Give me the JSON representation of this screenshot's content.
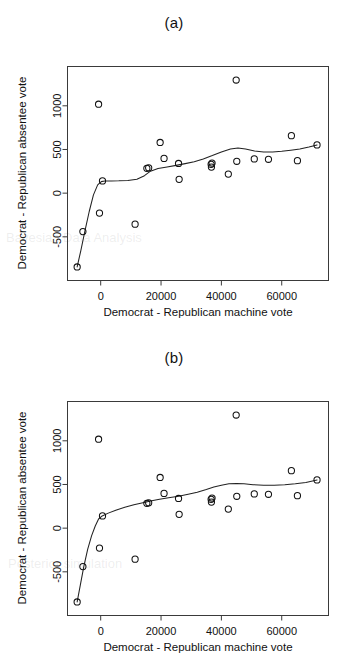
{
  "figure": {
    "background": "#ffffff",
    "ink": "#111111",
    "panels": [
      {
        "id": "a",
        "title": "(a)",
        "fit_label": "loess-smooth-fit"
      },
      {
        "id": "b",
        "title": "(b)",
        "fit_label": "monotone-smooth-fit"
      }
    ]
  },
  "chart_data": [
    {
      "type": "scatter",
      "title": "(a)",
      "xlabel": "Democrat - Republican machine vote",
      "ylabel": "Democrat - Republican absentee vote",
      "xlim": [
        -11000,
        75500
      ],
      "ylim": [
        -1000,
        1450
      ],
      "xticks": [
        0,
        20000,
        40000,
        60000
      ],
      "xticklabels": [
        "0",
        "20000",
        "40000",
        "60000"
      ],
      "yticks": [
        -500,
        0,
        500,
        1000
      ],
      "yticklabels": [
        "-500",
        "0",
        "500",
        "1000"
      ],
      "grid": false,
      "legend": "none",
      "marker": "open-circle",
      "x": [
        -7800,
        -5900,
        -700,
        -400,
        600,
        11400,
        15300,
        15900,
        19700,
        21000,
        25800,
        26000,
        36600,
        36700,
        36900,
        42300,
        44900,
        45100,
        50900,
        55600,
        63200,
        65200,
        71700
      ],
      "y": [
        -845,
        -440,
        1018,
        -228,
        140,
        -355,
        285,
        290,
        580,
        398,
        340,
        158,
        330,
        298,
        345,
        218,
        1295,
        365,
        392,
        388,
        658,
        372,
        552
      ],
      "series": [
        {
          "name": "observations",
          "kind": "points",
          "x": [
            -7800,
            -5900,
            -700,
            -400,
            600,
            11400,
            15300,
            15900,
            19700,
            21000,
            25800,
            26000,
            36600,
            36700,
            36900,
            42300,
            44900,
            45100,
            50900,
            55600,
            63200,
            65200,
            71700
          ],
          "y": [
            -845,
            -440,
            1018,
            -228,
            140,
            -355,
            285,
            290,
            580,
            398,
            340,
            158,
            330,
            298,
            345,
            218,
            1295,
            365,
            392,
            388,
            658,
            372,
            552
          ]
        },
        {
          "name": "smooth-fit",
          "kind": "line",
          "x": [
            -7800,
            -6600,
            -5200,
            -3800,
            -2400,
            -1000,
            200,
            1400,
            3500,
            6000,
            9000,
            12000,
            14500,
            16500,
            19000,
            22000,
            25000,
            28000,
            31000,
            34000,
            37000,
            40000,
            43000,
            45500,
            48000,
            51000,
            54000,
            57000,
            60000,
            63000,
            66000,
            69000,
            71700
          ],
          "y": [
            -845,
            -660,
            -430,
            -210,
            -20,
            95,
            132,
            140,
            140,
            141,
            146,
            160,
            200,
            252,
            282,
            300,
            318,
            338,
            360,
            392,
            430,
            472,
            505,
            518,
            505,
            482,
            470,
            472,
            480,
            492,
            505,
            528,
            552
          ]
        }
      ]
    },
    {
      "type": "scatter",
      "title": "(b)",
      "xlabel": "Democrat - Republican machine vote",
      "ylabel": "Democrat - Republican absentee vote",
      "xlim": [
        -11000,
        75500
      ],
      "ylim": [
        -1000,
        1450
      ],
      "xticks": [
        0,
        20000,
        40000,
        60000
      ],
      "xticklabels": [
        "0",
        "20000",
        "40000",
        "60000"
      ],
      "yticks": [
        -500,
        0,
        500,
        1000
      ],
      "yticklabels": [
        "-500",
        "0",
        "500",
        "1000"
      ],
      "grid": false,
      "legend": "none",
      "marker": "open-circle",
      "x": [
        -7800,
        -5900,
        -700,
        -400,
        600,
        11400,
        15300,
        15900,
        19700,
        21000,
        25800,
        26000,
        36600,
        36700,
        36900,
        42300,
        44900,
        45100,
        50900,
        55600,
        63200,
        65200,
        71700
      ],
      "y": [
        -845,
        -440,
        1018,
        -228,
        140,
        -355,
        285,
        290,
        580,
        398,
        340,
        158,
        330,
        298,
        345,
        218,
        1295,
        365,
        392,
        388,
        658,
        372,
        552
      ],
      "series": [
        {
          "name": "observations",
          "kind": "points",
          "x": [
            -7800,
            -5900,
            -700,
            -400,
            600,
            11400,
            15300,
            15900,
            19700,
            21000,
            25800,
            26000,
            36600,
            36700,
            36900,
            42300,
            44900,
            45100,
            50900,
            55600,
            63200,
            65200,
            71700
          ],
          "y": [
            -845,
            -440,
            1018,
            -228,
            140,
            -355,
            285,
            290,
            580,
            398,
            340,
            158,
            330,
            298,
            345,
            218,
            1295,
            365,
            392,
            388,
            658,
            372,
            552
          ]
        },
        {
          "name": "smooth-fit",
          "kind": "line",
          "x": [
            -7800,
            -6800,
            -5600,
            -4300,
            -3000,
            -1800,
            -700,
            500,
            2500,
            5000,
            8000,
            11000,
            14000,
            16500,
            19500,
            22500,
            25800,
            29000,
            32000,
            35000,
            37500,
            40000,
            42500,
            45000,
            47500,
            50500,
            54000,
            57500,
            61000,
            64500,
            68000,
            71700
          ],
          "y": [
            -845,
            -660,
            -440,
            -240,
            -85,
            25,
            105,
            140,
            172,
            206,
            240,
            268,
            292,
            310,
            330,
            348,
            365,
            388,
            412,
            442,
            470,
            492,
            508,
            512,
            508,
            498,
            492,
            492,
            498,
            508,
            522,
            552
          ]
        }
      ]
    }
  ],
  "page_bleed": [
    {
      "text": "Bayesian Data Analysis",
      "left": 6,
      "top": 230
    },
    {
      "text": "Posterior simulation",
      "left": 8,
      "top": 556
    }
  ]
}
